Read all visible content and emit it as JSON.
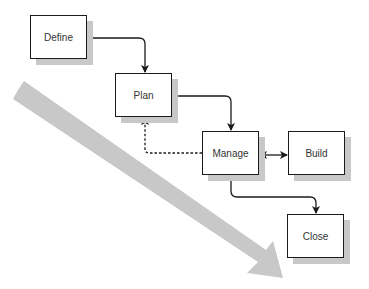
{
  "diagram": {
    "colors": {
      "box_border": "#1a1a1a",
      "shadow": "#c8c8c8",
      "big_arrow": "#c8c8c8",
      "connector": "#1a1a1a",
      "text": "#333333"
    },
    "nodes": [
      {
        "id": "define",
        "label": "Define",
        "x": 30,
        "y": 15
      },
      {
        "id": "plan",
        "label": "Plan",
        "x": 115,
        "y": 73
      },
      {
        "id": "manage",
        "label": "Manage",
        "x": 202,
        "y": 131
      },
      {
        "id": "build",
        "label": "Build",
        "x": 288,
        "y": 131
      },
      {
        "id": "close",
        "label": "Close",
        "x": 287,
        "y": 214
      }
    ],
    "edges": [
      {
        "from": "define",
        "to": "plan",
        "style": "solid",
        "arrow": "end"
      },
      {
        "from": "plan",
        "to": "manage",
        "style": "solid",
        "arrow": "end"
      },
      {
        "from": "manage",
        "to": "plan",
        "style": "dashed",
        "arrow": "end"
      },
      {
        "from": "manage",
        "to": "build",
        "style": "solid",
        "arrow": "both"
      },
      {
        "from": "manage",
        "to": "close",
        "style": "solid",
        "arrow": "end"
      }
    ],
    "big_arrow": {
      "from": [
        22,
        95
      ],
      "to": [
        283,
        278
      ],
      "meaning": "progression-direction"
    }
  }
}
